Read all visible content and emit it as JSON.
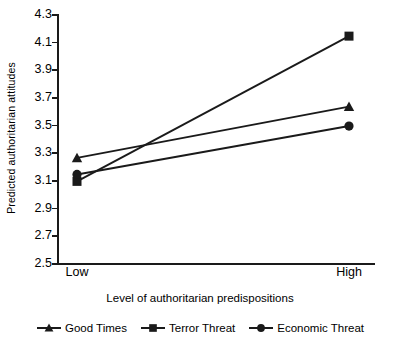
{
  "chart_data": {
    "type": "line",
    "title": "",
    "xlabel": "Level of authoritarian predispositions",
    "ylabel": "Predicted authoritarian attitudes",
    "categories": [
      "Low",
      "High"
    ],
    "x": [
      0,
      1
    ],
    "xtick_labels": [
      "Low",
      "High"
    ],
    "ylim": [
      2.5,
      4.3
    ],
    "ytick_labels": [
      "4.3",
      "4.1",
      "3.9",
      "3.7",
      "3.5",
      "3.3",
      "3.1",
      "2.9",
      "2.7",
      "2.5"
    ],
    "ytick_values": [
      4.3,
      4.1,
      3.9,
      3.7,
      3.5,
      3.3,
      3.1,
      2.9,
      2.7,
      2.5
    ],
    "grid": false,
    "legend_position": "bottom",
    "series": [
      {
        "name": "Good Times",
        "marker": "triangle",
        "color": "#1a1a1a",
        "values": [
          3.26,
          3.63
        ]
      },
      {
        "name": "Terror Threat",
        "marker": "square",
        "color": "#1a1a1a",
        "values": [
          3.09,
          4.14
        ]
      },
      {
        "name": "Economic Threat",
        "marker": "circle",
        "color": "#1a1a1a",
        "values": [
          3.14,
          3.49
        ]
      }
    ]
  },
  "legend": {
    "items": [
      {
        "label": "Good Times",
        "marker": "triangle-marker-icon"
      },
      {
        "label": "Terror Threat",
        "marker": "square-marker-icon"
      },
      {
        "label": "Economic Threat",
        "marker": "circle-marker-icon"
      }
    ]
  }
}
